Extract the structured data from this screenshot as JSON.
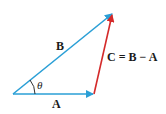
{
  "diagram": {
    "vectors": [
      {
        "name": "A",
        "label": "A",
        "from": [
          13,
          94
        ],
        "to": [
          94,
          94
        ],
        "color": "#2a9fd6"
      },
      {
        "name": "B",
        "label": "B",
        "from": [
          13,
          94
        ],
        "to": [
          113,
          13
        ],
        "color": "#2a9fd6"
      },
      {
        "name": "C",
        "label": "C = B − A",
        "from": [
          94,
          94
        ],
        "to": [
          113,
          13
        ],
        "color": "#d42a2a"
      }
    ],
    "angle_label": "θ",
    "labels": {
      "A": "A",
      "B": "B",
      "C": "C = B − A",
      "theta": "θ"
    }
  }
}
